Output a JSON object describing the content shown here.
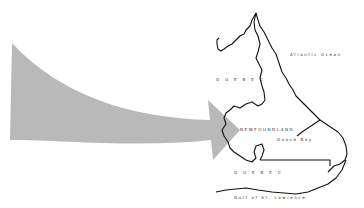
{
  "map": {
    "labels": {
      "ocean": "Atlantic Ocean",
      "quebec_north": "QUEBEC",
      "newfoundland": "NEWFOUNDLAND",
      "bay": "Goose Bay",
      "quebec_south": "QUEBEC",
      "gulf": "Gulf of St. Lawrence"
    },
    "colors": {
      "arrow": "#b9b9b9",
      "outline": "#111111",
      "background": "#ffffff"
    }
  }
}
